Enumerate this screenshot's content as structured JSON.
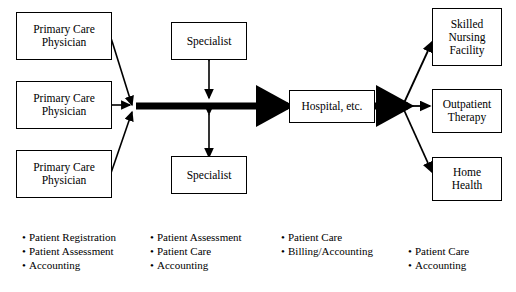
{
  "diagram": {
    "nodes": [
      {
        "id": "pcp1",
        "label": "Primary Care\nPhysician"
      },
      {
        "id": "pcp2",
        "label": "Primary Care\nPhysician"
      },
      {
        "id": "pcp3",
        "label": "Primary Care\nPhysician"
      },
      {
        "id": "spec1",
        "label": "Specialist"
      },
      {
        "id": "spec2",
        "label": "Specialist"
      },
      {
        "id": "hospital",
        "label": "Hospital, etc."
      },
      {
        "id": "snf",
        "label": "Skilled\nNursing\nFacility"
      },
      {
        "id": "outpatient",
        "label": "Outpatient\nTherapy"
      },
      {
        "id": "homehealth",
        "label": "Home\nHealth"
      }
    ],
    "legend_columns": [
      {
        "id": "col1",
        "items": [
          "Patient Registration",
          "Patient Assessment",
          "Accounting"
        ]
      },
      {
        "id": "col2",
        "items": [
          "Patient Assessment",
          "Patient Care",
          "Accounting"
        ]
      },
      {
        "id": "col3",
        "items": [
          "Patient Care",
          "Billing/Accounting"
        ]
      },
      {
        "id": "col4",
        "items": [
          "Patient Care",
          "Accounting"
        ]
      }
    ],
    "colors": {
      "line": "#000000",
      "box_fill": "#ffffff",
      "text": "#000000"
    }
  }
}
